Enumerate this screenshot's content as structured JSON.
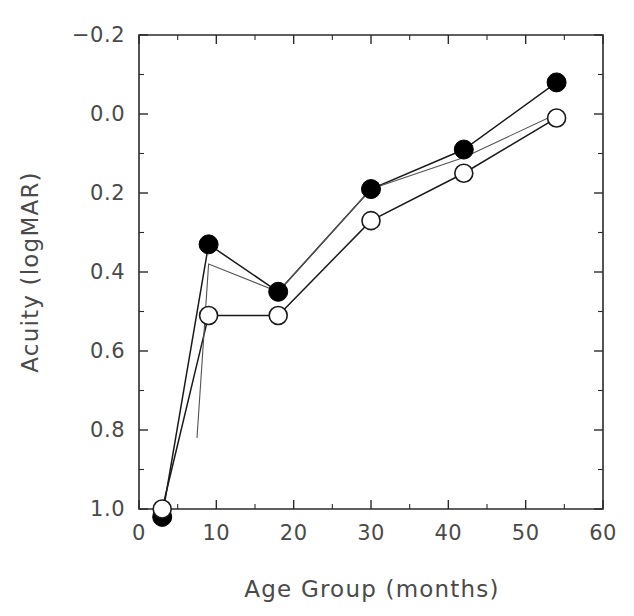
{
  "figure": {
    "background": "#ffffff",
    "ink_color": "#1a1a1a",
    "label_color": "#4a4a4a"
  },
  "chart_data": {
    "type": "line",
    "title": "",
    "xlabel": "Age Group (months)",
    "ylabel": "Acuity (logMAR)",
    "xlim": [
      0,
      60
    ],
    "ylim": [
      -0.2,
      1.0
    ],
    "y_axis_inverted": true,
    "grid": false,
    "legend": "none",
    "x_ticks": [
      0,
      10,
      20,
      30,
      40,
      50,
      60
    ],
    "x_tick_labels": [
      "0",
      "10",
      "20",
      "30",
      "40",
      "50",
      "60"
    ],
    "x_minor_ticks": [
      5,
      15,
      25,
      35,
      45,
      55
    ],
    "y_ticks": [
      -0.2,
      0.0,
      0.2,
      0.4,
      0.6,
      0.8,
      1.0
    ],
    "y_tick_labels": [
      "-0.2",
      "0.0",
      "0.2",
      "0.4",
      "0.6",
      "0.8",
      "1.0"
    ],
    "y_minor_ticks": [
      -0.1,
      0.1,
      0.3,
      0.5,
      0.7,
      0.9,
      1.1
    ],
    "x": [
      3,
      9,
      18,
      30,
      42,
      54
    ],
    "series": [
      {
        "name": "filled-circles",
        "marker": "filled-circle",
        "x": [
          3,
          9,
          18,
          30,
          42,
          54
        ],
        "values": [
          1.02,
          0.33,
          0.45,
          0.19,
          0.09,
          -0.08
        ]
      },
      {
        "name": "open-circles",
        "marker": "open-circle",
        "x": [
          3,
          9,
          18,
          30,
          42,
          54
        ],
        "values": [
          1.0,
          0.51,
          0.51,
          0.27,
          0.15,
          0.01
        ]
      },
      {
        "name": "unmarked-thin",
        "marker": "none",
        "x": [
          7.5,
          9,
          18,
          30,
          42,
          54
        ],
        "values": [
          0.82,
          0.38,
          0.45,
          0.19,
          0.11,
          0.0
        ]
      }
    ]
  }
}
